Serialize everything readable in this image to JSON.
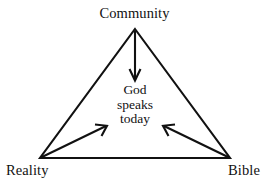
{
  "diagram": {
    "title_text": "God speaks today",
    "background_color": "#ffffff",
    "stroke_color": "#111111",
    "vertices": {
      "top": {
        "label": "Community",
        "x": 135,
        "y": 29
      },
      "bottom_left": {
        "label": "Reality",
        "x": 40,
        "y": 158
      },
      "bottom_right": {
        "label": "Bible",
        "x": 230,
        "y": 158
      }
    },
    "center": {
      "lines": [
        "God",
        "speaks",
        "today"
      ],
      "line1": "God",
      "line2": "speaks",
      "line3": "today"
    },
    "arrows": [
      {
        "name": "community-to-center",
        "from": "Community",
        "to": "God speaks today",
        "direction": "down"
      },
      {
        "name": "reality-to-center",
        "from": "Reality",
        "to": "God speaks today",
        "direction": "up-right"
      },
      {
        "name": "bible-to-center",
        "from": "Bible",
        "to": "God speaks today",
        "direction": "up-left"
      }
    ]
  }
}
